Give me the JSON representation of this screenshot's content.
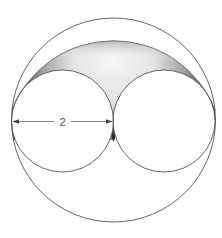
{
  "diagram": {
    "type": "geometry-figure",
    "dimension_label": "2",
    "dimension_target": "diameter of left small circle",
    "shapes": {
      "outer_circle": {
        "cx": 113.5,
        "cy": 120,
        "r": 102
      },
      "left_circle": {
        "cx": 62.5,
        "cy": 121,
        "r": 51
      },
      "right_circle": {
        "cx": 164,
        "cy": 121,
        "r": 51
      },
      "shaded_arc": {
        "from": [
          12,
          110
        ],
        "to": [
          215,
          110
        ],
        "peak_y": 41
      }
    },
    "colors": {
      "stroke": "#555555",
      "shade_light": "#f4f4f4",
      "shade_dark": "#3a3a3a",
      "background": "#ffffff"
    }
  }
}
